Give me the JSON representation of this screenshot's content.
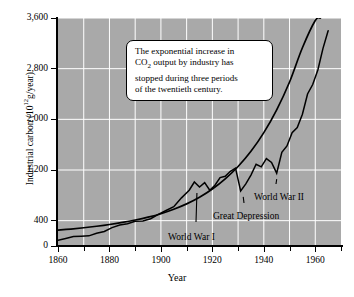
{
  "chart_data": {
    "type": "line",
    "title": "",
    "xlabel": "Year",
    "ylabel": "Industrial carbon (10^12 g/year)",
    "ylabel_base": "Industrial carbon (10",
    "ylabel_exp": "12",
    "ylabel_tail": "g/year)",
    "xlim": [
      1860,
      1970
    ],
    "ylim": [
      0,
      3600
    ],
    "grid": true,
    "legend": "none",
    "background_color": "#a9a9a9",
    "gridline_color": "#ffffff",
    "line_color": "#000000",
    "xticks_major": [
      1860,
      1880,
      1900,
      1920,
      1940,
      1960
    ],
    "xticks_minor": [
      1870,
      1890,
      1910,
      1930,
      1950,
      1970
    ],
    "xtick_labels": [
      "1860",
      "1880",
      "1900",
      "1920",
      "1940",
      "1960"
    ],
    "yticks": [
      0,
      400,
      1200,
      2000,
      2800,
      3600
    ],
    "ytick_labels": [
      "0",
      "400",
      "1,200",
      "2,000",
      "2,800",
      "3,600"
    ],
    "series": [
      {
        "name": "exponential trend",
        "style": "smooth",
        "x": [
          1860,
          1865,
          1870,
          1875,
          1880,
          1885,
          1890,
          1895,
          1900,
          1905,
          1910,
          1915,
          1920,
          1925,
          1930,
          1935,
          1940,
          1945,
          1950,
          1955,
          1960,
          1962
        ],
        "values": [
          250,
          268,
          288,
          312,
          340,
          372,
          410,
          455,
          510,
          580,
          665,
          770,
          900,
          1060,
          1255,
          1495,
          1790,
          2150,
          2590,
          3130,
          3560,
          3600
        ]
      },
      {
        "name": "industrial carbon output",
        "style": "jagged annual data",
        "x": [
          1860,
          1863,
          1866,
          1869,
          1872,
          1875,
          1878,
          1881,
          1884,
          1887,
          1890,
          1893,
          1896,
          1899,
          1902,
          1905,
          1908,
          1911,
          1913,
          1915,
          1917,
          1919,
          1921,
          1923,
          1925,
          1927,
          1929,
          1931,
          1933,
          1935,
          1937,
          1939,
          1941,
          1943,
          1945,
          1947,
          1949,
          1951,
          1953,
          1955,
          1957,
          1959,
          1961,
          1963,
          1965
        ],
        "values": [
          90,
          120,
          150,
          155,
          160,
          200,
          230,
          290,
          330,
          350,
          390,
          395,
          430,
          500,
          560,
          620,
          760,
          880,
          1010,
          930,
          1000,
          880,
          960,
          1080,
          1100,
          1180,
          1230,
          870,
          980,
          1120,
          1290,
          1250,
          1380,
          1320,
          1150,
          1480,
          1580,
          1790,
          1870,
          2080,
          2400,
          2550,
          2780,
          3120,
          3400
        ]
      }
    ],
    "annotations": [
      {
        "id": "world-war-1",
        "label": "World War I",
        "points_to_year": 1914,
        "points_to_value": 930
      },
      {
        "id": "great-depression",
        "label": "Great Depression",
        "points_to_year": 1932,
        "points_to_value": 870
      },
      {
        "id": "world-war-2",
        "label": "World War II",
        "points_to_year": 1945,
        "points_to_value": 1150
      }
    ],
    "callout": {
      "line1_a": "The exponential increase in",
      "line2_a": "CO",
      "line2_sub": "2",
      "line2_b": " output by industry has",
      "line3": "stopped during three periods",
      "line4": "of the twentieth century."
    }
  }
}
